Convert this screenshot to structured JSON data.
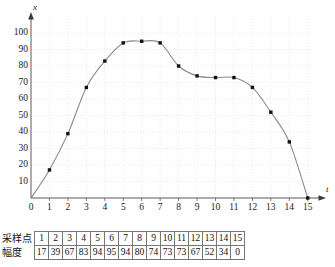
{
  "chart_data": {
    "type": "line",
    "title": "",
    "xlabel": "t",
    "ylabel": "x",
    "xlim": [
      0,
      15
    ],
    "ylim": [
      0,
      105
    ],
    "grid": true,
    "legend": "none",
    "marker": "square",
    "curve": "smooth",
    "x": [
      1,
      2,
      3,
      4,
      5,
      6,
      7,
      8,
      9,
      10,
      11,
      12,
      13,
      14,
      15
    ],
    "values": [
      17,
      39,
      67,
      83,
      94,
      95,
      94,
      80,
      74,
      73,
      73,
      67,
      52,
      34,
      0
    ],
    "series": [
      {
        "name": "幅度",
        "values": [
          17,
          39,
          67,
          83,
          94,
          95,
          94,
          80,
          74,
          73,
          73,
          67,
          52,
          34,
          0
        ]
      }
    ],
    "xticks": [
      "0",
      "1",
      "2",
      "3",
      "4",
      "5",
      "6",
      "7",
      "8",
      "9",
      "10",
      "11",
      "12",
      "13",
      "14",
      "15"
    ],
    "yticks": [
      "10",
      "20",
      "30",
      "40",
      "50",
      "60",
      "70",
      "80",
      "90",
      "100"
    ],
    "colors": {
      "curve": "#8a8a8a",
      "marker": "#111111",
      "axis": "#444444",
      "grid": "#e8d8d8",
      "text": "#111111"
    }
  },
  "table": {
    "row_labels": [
      "采样点",
      "幅度"
    ],
    "sample_points": [
      "1",
      "2",
      "3",
      "4",
      "5",
      "6",
      "7",
      "8",
      "9",
      "10",
      "11",
      "12",
      "13",
      "14",
      "15"
    ],
    "amplitudes": [
      "17",
      "39",
      "67",
      "83",
      "94",
      "95",
      "94",
      "80",
      "74",
      "73",
      "73",
      "67",
      "52",
      "34",
      "0"
    ]
  }
}
